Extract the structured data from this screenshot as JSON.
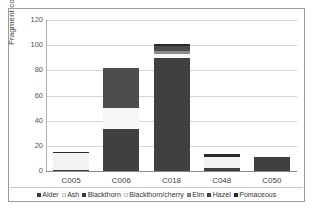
{
  "chart_data": {
    "type": "bar",
    "subtype": "stacked-column",
    "title": "",
    "xlabel": "",
    "ylabel": "Fragment count",
    "ylim": [
      0,
      120
    ],
    "yticks": [
      0,
      20,
      40,
      60,
      80,
      100,
      120
    ],
    "ytick_labels": [
      "0",
      "20",
      "40",
      "60",
      "80",
      "100",
      "120"
    ],
    "grid": true,
    "legend_position": "bottom",
    "categories": [
      "C005",
      "C006",
      "C018",
      "C048",
      "C050"
    ],
    "series": [
      {
        "name": "Alder",
        "color": "#3f3f3f",
        "values": [
          1,
          0,
          0,
          2,
          0
        ]
      },
      {
        "name": "Ash",
        "color": "#f2f2f2",
        "values": [
          13,
          0,
          0,
          9,
          0
        ]
      },
      {
        "name": "Blackthorn",
        "color": "#404040",
        "values": [
          0,
          33,
          90,
          0,
          11
        ]
      },
      {
        "name": "Blackthorn/cherry",
        "color": "#f7f7f7",
        "values": [
          0,
          17,
          3,
          0,
          0
        ]
      },
      {
        "name": "Elm",
        "color": "#8c8c8c",
        "values": [
          0,
          0,
          2,
          0,
          0
        ]
      },
      {
        "name": "Hazel",
        "color": "#4d4d4d",
        "values": [
          0,
          32,
          4,
          0,
          0
        ]
      },
      {
        "name": "Pomaceous",
        "color": "#2b2b2b",
        "values": [
          1.5,
          0,
          2,
          2.5,
          0
        ]
      }
    ],
    "totals": [
      15.5,
      82,
      101,
      13.5,
      11
    ]
  },
  "axis": {
    "y_title": "Fragment count"
  },
  "legend": {
    "items": [
      {
        "label": "Alder"
      },
      {
        "label": "Ash"
      },
      {
        "label": "Blackthorn"
      },
      {
        "label": "Blackthorn/cherry"
      },
      {
        "label": "Elm"
      },
      {
        "label": "Hazel"
      },
      {
        "label": "Pomaceous"
      }
    ]
  }
}
